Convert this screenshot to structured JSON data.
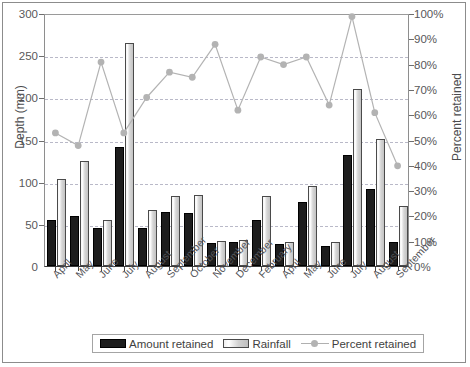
{
  "chart_data": {
    "type": "bar",
    "title": "",
    "subtitle": "",
    "xlabel": "",
    "ylabel": "Depth (mm)",
    "ylabel_secondary": "Percent retained",
    "ylim": [
      0,
      300
    ],
    "ylim_secondary": [
      0,
      100
    ],
    "yticks": [
      0,
      50,
      100,
      150,
      200,
      250,
      300
    ],
    "yticks_secondary": [
      "0%",
      "10%",
      "20%",
      "30%",
      "40%",
      "50%",
      "60%",
      "70%",
      "80%",
      "90%",
      "100%"
    ],
    "grid": true,
    "grid_axis": "y",
    "legend_position": "bottom",
    "categories": [
      "April",
      "May",
      "June",
      "July",
      "August",
      "September",
      "October",
      "November",
      "December",
      "February",
      "April",
      "May",
      "June",
      "July",
      "August",
      "September"
    ],
    "series": [
      {
        "name": "Amount retained",
        "type": "bar",
        "axis": "left",
        "unit": "mm",
        "color": "#1d1d1d",
        "values": [
          55,
          59,
          45,
          141,
          45,
          64,
          63,
          27,
          28,
          54,
          26,
          76,
          24,
          132,
          91,
          29
        ]
      },
      {
        "name": "Rainfall",
        "type": "bar",
        "axis": "left",
        "unit": "mm",
        "color": "#d2d2d2",
        "values": [
          103,
          124,
          55,
          265,
          66,
          83,
          84,
          30,
          31,
          83,
          28,
          95,
          28,
          210,
          151,
          71
        ]
      },
      {
        "name": "Percent retained",
        "type": "line",
        "axis": "right",
        "unit": "%",
        "color": "#b3b3b3",
        "values": [
          53,
          48,
          81,
          53,
          67,
          77,
          75,
          88,
          62,
          83,
          80,
          83,
          64,
          99,
          61,
          40
        ]
      }
    ],
    "legend_entries": [
      "Amount retained",
      "Rainfall",
      "Percent retained"
    ]
  }
}
